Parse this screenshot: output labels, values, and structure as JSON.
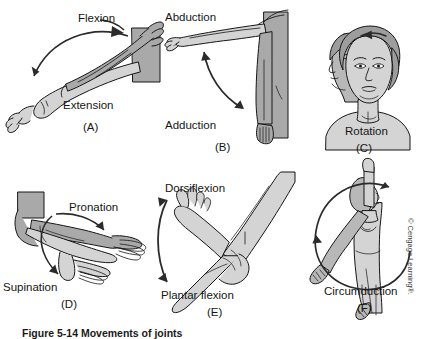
{
  "figure": {
    "caption": "Figure 5-14  Movements of joints",
    "credit": "© Cengage Learning®.",
    "background_color": "#ffffff",
    "ink_color": "#161616",
    "fill_light": "#d4d4d4",
    "fill_mid": "#a9a9a9",
    "fill_dark": "#8c8c8c"
  },
  "panels": [
    {
      "id": "A",
      "label": "(A)",
      "name": "panel-flexion-extension",
      "subject": "forearm-elbow",
      "terms": [
        "Flexion",
        "Extension"
      ],
      "arrow": "curved-single-headed",
      "top_label": "Flexion",
      "bottom_label": "Extension"
    },
    {
      "id": "B",
      "label": "(B)",
      "name": "panel-abduction-adduction",
      "subject": "shoulder-arm",
      "terms": [
        "Abduction",
        "Adduction"
      ],
      "arrow": "curved-double-headed",
      "top_label": "Abduction",
      "bottom_label": "Adduction"
    },
    {
      "id": "C",
      "label": "(C)",
      "name": "panel-rotation",
      "subject": "head-neck",
      "terms": [
        "Rotation"
      ],
      "arrow": "small-curved",
      "bottom_label": "Rotation"
    },
    {
      "id": "D",
      "label": "(D)",
      "name": "panel-pronation-supination",
      "subject": "forearm-hand",
      "terms": [
        "Pronation",
        "Supination"
      ],
      "arrow": "two-curved-wrapping",
      "top_label": "Pronation",
      "bottom_label": "Supination"
    },
    {
      "id": "E",
      "label": "(E)",
      "name": "panel-dorsiflexion-plantarflexion",
      "subject": "ankle-foot",
      "terms": [
        "Dorsiflexion",
        "Plantar flexion"
      ],
      "arrow": "curved-double-headed",
      "top_label": "Dorsiflexion",
      "bottom_label": "Plantar flexion"
    },
    {
      "id": "F",
      "label": "(F)",
      "name": "panel-circumduction",
      "subject": "standing-figure-arm",
      "terms": [
        "Circumduction"
      ],
      "arrow": "full-circle-double-headed",
      "bottom_label": "Circumduction"
    }
  ]
}
